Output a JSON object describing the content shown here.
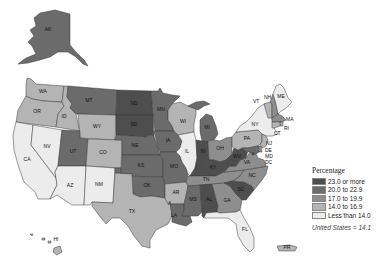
{
  "colors": {
    "c1": "#4e4e4e",
    "c2": "#6b6b6b",
    "c3": "#8e8e8e",
    "c4": "#b4b4b4",
    "c5": "#ececec",
    "border": "#3a3a3a"
  },
  "legend": {
    "title": "Percentage",
    "items": [
      {
        "label": "23.0 or more",
        "class": "c1"
      },
      {
        "label": "20.0 to 22.9",
        "class": "c2"
      },
      {
        "label": "17.0 to 19.9",
        "class": "c3"
      },
      {
        "label": "14.0 to 16.9",
        "class": "c4"
      },
      {
        "label": "Less than 14.0",
        "class": "c5"
      }
    ],
    "national_note": "United States = 14.1"
  },
  "states": [
    {
      "abbr": "AK",
      "class": "c2"
    },
    {
      "abbr": "HI",
      "class": "c4"
    },
    {
      "abbr": "PR",
      "class": "c4"
    },
    {
      "abbr": "WA",
      "class": "c4"
    },
    {
      "abbr": "OR",
      "class": "c4"
    },
    {
      "abbr": "CA",
      "class": "c5"
    },
    {
      "abbr": "NV",
      "class": "c5"
    },
    {
      "abbr": "ID",
      "class": "c4"
    },
    {
      "abbr": "MT",
      "class": "c2"
    },
    {
      "abbr": "WY",
      "class": "c4"
    },
    {
      "abbr": "UT",
      "class": "c2"
    },
    {
      "abbr": "CO",
      "class": "c4"
    },
    {
      "abbr": "AZ",
      "class": "c5"
    },
    {
      "abbr": "NM",
      "class": "c5"
    },
    {
      "abbr": "ND",
      "class": "c1"
    },
    {
      "abbr": "SD",
      "class": "c1"
    },
    {
      "abbr": "NE",
      "class": "c2"
    },
    {
      "abbr": "KS",
      "class": "c2"
    },
    {
      "abbr": "OK",
      "class": "c2"
    },
    {
      "abbr": "TX",
      "class": "c4"
    },
    {
      "abbr": "MN",
      "class": "c2"
    },
    {
      "abbr": "IA",
      "class": "c2"
    },
    {
      "abbr": "MO",
      "class": "c2"
    },
    {
      "abbr": "AR",
      "class": "c4"
    },
    {
      "abbr": "LA",
      "class": "c2"
    },
    {
      "abbr": "WI",
      "class": "c4"
    },
    {
      "abbr": "IL",
      "class": "c5"
    },
    {
      "abbr": "MI",
      "class": "c2"
    },
    {
      "abbr": "IN",
      "class": "c1"
    },
    {
      "abbr": "OH",
      "class": "c3"
    },
    {
      "abbr": "KY",
      "class": "c1"
    },
    {
      "abbr": "TN",
      "class": "c3"
    },
    {
      "abbr": "MS",
      "class": "c2"
    },
    {
      "abbr": "AL",
      "class": "c1"
    },
    {
      "abbr": "GA",
      "class": "c3"
    },
    {
      "abbr": "FL",
      "class": "c5"
    },
    {
      "abbr": "SC",
      "class": "c1"
    },
    {
      "abbr": "NC",
      "class": "c3"
    },
    {
      "abbr": "VA",
      "class": "c3"
    },
    {
      "abbr": "WV",
      "class": "c1"
    },
    {
      "abbr": "PA",
      "class": "c4"
    },
    {
      "abbr": "NY",
      "class": "c5"
    },
    {
      "abbr": "VT",
      "class": "c4"
    },
    {
      "abbr": "NH",
      "class": "c3"
    },
    {
      "abbr": "ME",
      "class": "c5"
    },
    {
      "abbr": "MA",
      "class": "c3"
    },
    {
      "abbr": "RI",
      "class": "c4"
    },
    {
      "abbr": "CT",
      "class": "c4"
    },
    {
      "abbr": "NJ",
      "class": "c4"
    },
    {
      "abbr": "DE",
      "class": "c3"
    },
    {
      "abbr": "MD",
      "class": "c2"
    },
    {
      "abbr": "DC",
      "class": "c1"
    }
  ]
}
